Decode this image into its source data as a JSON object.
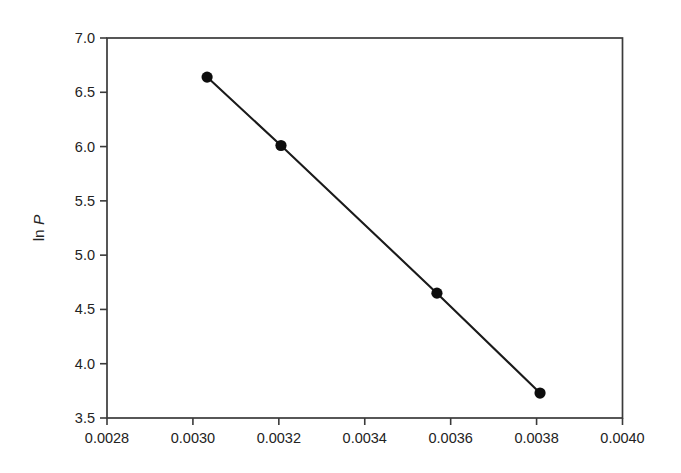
{
  "chart_data": {
    "type": "line",
    "title": "",
    "subtitle": "",
    "xlabel": "",
    "ylabel": "ln P",
    "ylabel_parts": [
      {
        "text": "ln ",
        "italic": false
      },
      {
        "text": "P",
        "italic": true
      }
    ],
    "xlim": [
      0.0028,
      0.004
    ],
    "ylim": [
      3.5,
      7.0
    ],
    "grid": false,
    "legend": null,
    "legend_position": "none",
    "frame": "box",
    "tick_direction": "out",
    "x_ticks": [
      0.0028,
      0.003,
      0.0032,
      0.0034,
      0.0036,
      0.0038,
      0.004
    ],
    "x_tick_labels": [
      "0.0028",
      "0.0030",
      "0.0032",
      "0.0034",
      "0.0036",
      "0.0038",
      "0.0040"
    ],
    "y_ticks": [
      3.5,
      4.0,
      4.5,
      5.0,
      5.5,
      6.0,
      6.5,
      7.0
    ],
    "y_tick_labels": [
      "3.5",
      "4.0",
      "4.5",
      "5.0",
      "5.5",
      "6.0",
      "6.5",
      "7.0"
    ],
    "series": [
      {
        "name": "ln P vs 1/T",
        "marker": "filled-circle",
        "marker_color": "#0d0d0d",
        "line_color": "#1a1a1a",
        "x": [
          0.003033,
          0.003205,
          0.003568,
          0.003808
        ],
        "y": [
          6.64,
          6.01,
          4.65,
          3.73
        ]
      }
    ],
    "annotations": []
  },
  "colors": {
    "background": "#ffffff",
    "axis": "#3a3a3a",
    "text": "#232323",
    "marker": "#0d0d0d",
    "line": "#1a1a1a"
  }
}
